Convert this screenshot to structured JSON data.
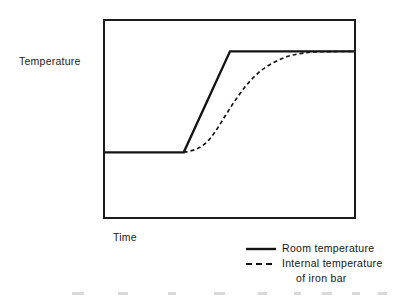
{
  "figure": {
    "y_axis_label": "Temperature",
    "x_axis_label": "Time",
    "frame": {
      "stroke": "#1b1b1b",
      "stroke_width": 2
    }
  },
  "legend": {
    "position": "bottom-right",
    "entries": [
      {
        "sample": "solid-line-sample",
        "label": "Room temperature",
        "label_line2": "",
        "style": "solid",
        "color": "#141414"
      },
      {
        "sample": "dashed-line-sample",
        "label": "Internal temperature",
        "label_line2": "of  iron bar",
        "style": "dashed",
        "color": "#141414"
      }
    ]
  },
  "chart_data": {
    "type": "line",
    "title": "",
    "xlabel": "Time",
    "ylabel": "Temperature",
    "xlim": [
      0,
      253
    ],
    "ylim": [
      0,
      200
    ],
    "grid": false,
    "axis_ticks": false,
    "axis_tick_labels": false,
    "legend_position": "bottom-right",
    "annotations": [],
    "series": [
      {
        "name": "Room temperature",
        "style": "solid",
        "color": "#141414",
        "linewidth": 2,
        "description": "Flat at ambient level, then a straight linear ramp up to the final plateau, then flat at the high level.",
        "points": [
          {
            "x": 0,
            "y": 134
          },
          {
            "x": 80,
            "y": 134
          },
          {
            "x": 127,
            "y": 31
          },
          {
            "x": 253,
            "y": 31
          }
        ]
      },
      {
        "name": "Internal temperature of iron bar",
        "style": "dashed",
        "color": "#141414",
        "linewidth": 1.4,
        "dash_pattern": [
          4,
          3
        ],
        "description": "Lags the room temperature: stays near ambient, rises as a sigmoid (S-curve) with an inflection mid-rise, then asymptotically approaches the same high plateau.",
        "points": [
          {
            "x": 80,
            "y": 134
          },
          {
            "x": 92,
            "y": 131
          },
          {
            "x": 103,
            "y": 124
          },
          {
            "x": 112,
            "y": 113
          },
          {
            "x": 122,
            "y": 97
          },
          {
            "x": 133,
            "y": 80
          },
          {
            "x": 145,
            "y": 64
          },
          {
            "x": 158,
            "y": 51
          },
          {
            "x": 172,
            "y": 42
          },
          {
            "x": 186,
            "y": 36
          },
          {
            "x": 200,
            "y": 33
          },
          {
            "x": 215,
            "y": 31.5
          },
          {
            "x": 253,
            "y": 31
          }
        ]
      }
    ]
  }
}
